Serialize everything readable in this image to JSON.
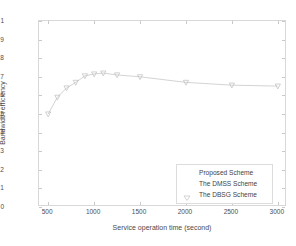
{
  "chart_data": {
    "type": "line",
    "title": "",
    "xlabel": "Service operation time (second)",
    "ylabel": "Bandwidth efficiency",
    "xlim": [
      400,
      3100
    ],
    "ylim": [
      0,
      1
    ],
    "grid": false,
    "legend_position": "lower right",
    "x_ticks": [
      500,
      1000,
      1500,
      2000,
      2500,
      3000
    ],
    "x_tick_labels": [
      "500",
      "1000",
      "1500",
      "2000",
      "2500",
      "3000"
    ],
    "y_ticks": [
      0,
      0.1,
      0.2,
      0.3,
      0.4,
      0.5,
      0.6,
      0.7,
      0.8,
      0.9,
      1
    ],
    "y_tick_labels": [
      "0",
      "0.1",
      "0.2",
      "0.3",
      "0.4",
      "0.5",
      "0.6",
      "0.7",
      "0.8",
      "0.9",
      "1"
    ],
    "series": [
      {
        "name": "Proposed Scheme",
        "marker": "v",
        "color": "#c8c8c8",
        "x": [
          500,
          600,
          700,
          800,
          900,
          1000,
          1100,
          1250,
          1500,
          2000,
          2500,
          3000
        ],
        "values": [
          0.5,
          0.59,
          0.64,
          0.67,
          0.705,
          0.715,
          0.72,
          0.71,
          0.7,
          0.67,
          0.655,
          0.65
        ]
      },
      {
        "name": "The DMSS Scheme",
        "marker": "none",
        "color": "#dcdcdc",
        "x": [],
        "values": []
      },
      {
        "name": "The DBSG Scheme",
        "marker": "v",
        "color": "#d0d0d0",
        "x": [],
        "values": []
      }
    ]
  },
  "legend": {
    "items": [
      {
        "label": "Proposed Scheme"
      },
      {
        "label": "The DMSS Scheme"
      },
      {
        "label": "The DBSG Scheme"
      }
    ]
  },
  "colors": {
    "axis": "#d8d8d8",
    "tick_text": "#4d4d4d",
    "axis_title": "#4a4a4a",
    "series_line": "#c8c8c8",
    "legend_border": "#dcdcdc",
    "background": "#ffffff"
  }
}
